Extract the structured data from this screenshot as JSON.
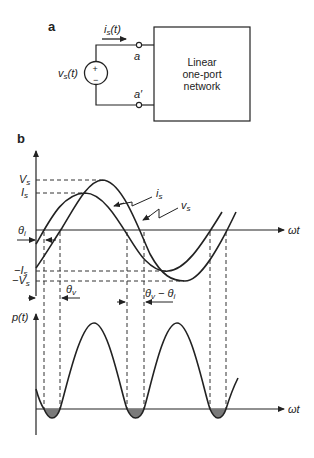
{
  "panel_a": {
    "label": "a",
    "current_label": "i",
    "current_sub": "s",
    "current_arg": "(t)",
    "source_label": "v",
    "source_sub": "s",
    "source_arg": "(t)",
    "plus": "+",
    "minus": "−",
    "terminal_top": "a",
    "terminal_bottom": "a′",
    "box_lines": [
      "Linear",
      "one-port",
      "network"
    ]
  },
  "panel_b": {
    "label": "b",
    "Vs": "V",
    "Is": "I",
    "negIs": "−I",
    "negVs": "−V",
    "sub_s": "s",
    "theta_i": "θ",
    "theta_i_sub": "i",
    "theta_v": "θ",
    "theta_v_sub": "v",
    "theta_diff_a": "θ",
    "theta_diff_a_sub": "v",
    "theta_diff_mid": " − θ",
    "theta_diff_b_sub": "i",
    "curve_i": "i",
    "curve_v": "v",
    "omega_t": "ωt",
    "power_label": "p(t)",
    "omega_t_2": "ωt"
  },
  "colors": {
    "stroke": "#222222",
    "shade": "#7a7a7a"
  }
}
